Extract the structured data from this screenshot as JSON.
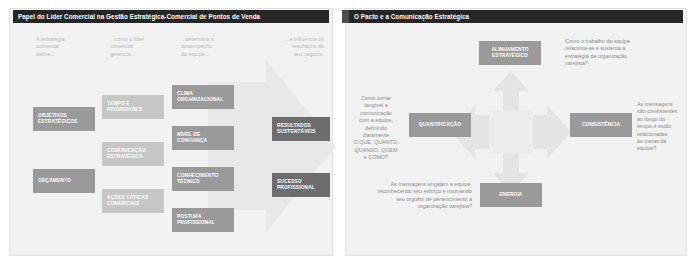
{
  "slide": {
    "background_color": "#ffffff",
    "panel_color": "#f2f2f2",
    "title_bar_color": "#262626",
    "box_mid_color": "#9a9a9a",
    "box_light_color": "#c6c6c6",
    "box_dark_color": "#6d6d6d",
    "caption_color": "#b9b9b9"
  },
  "left_panel": {
    "title": "Papel do Líder Comercial na Gestão Estratégica-Comercial de Pontos de Venda",
    "captions": [
      {
        "text": "A estratégia\ncomercial\ndefine..."
      },
      {
        "text": "...como o líder\ncomercial\ngerencia..."
      },
      {
        "text": "...determina o\ndesempenho\nda equipe..."
      },
      {
        "text": "...e influencia os\nresultados do\nseu negócio."
      }
    ],
    "column_1": [
      {
        "label": "OBJETIVOS\nESTRATÉGICOS"
      },
      {
        "label": "ORÇAMENTO"
      }
    ],
    "column_2": [
      {
        "label": "TEMPO E\nPRIORIDADES"
      },
      {
        "label": "COMUNICAÇÃO\nESTRATÉGICA"
      },
      {
        "label": "AÇÕES TÁTICAS\nCOMERCIAIS"
      }
    ],
    "column_3": [
      {
        "label": "CLIMA\nORGANIZACIONAL"
      },
      {
        "label": "NÍVEL DE\nCONFIANÇA"
      },
      {
        "label": "CONHECIMENTO\nTÉCNICO"
      },
      {
        "label": "POSTURA\nPROFISSIONAL"
      }
    ],
    "column_4": [
      {
        "label": "RESULTADOS\nSUSTENTÁVEIS"
      },
      {
        "label": "SUCESSO\nPROFISSIONAL"
      }
    ]
  },
  "right_panel": {
    "title": "O Pacto e a Comunicação Estratégica",
    "top_box": {
      "label": "ALINHAMENTO\nESTRATÉGICO"
    },
    "top_caption": "Como o trabalho da equipe\nrelaciona-se e sustenta a\nestratégia da organização\nvarejista?",
    "left_box": {
      "label": "QUANTIFICAÇÃO"
    },
    "left_caption": "Como tornar\ntangível a\ncomunicação\ncom a equipe,\ndefinindo\nclaramente\nO QUE, QUANTO,\nQUANDO, QUEM\ne COMO?",
    "right_box": {
      "label": "CONSISTÊNCIA"
    },
    "right_caption": "As mensagens\nsão consistentes\nao longo do\ntempo e estão\nrelacionadas\nàs metas da\nequipe?",
    "bottom_box": {
      "label": "ENERGIA"
    },
    "bottom_caption": "As mensagens engajam a equipe,\nreconhecendo seu esforço e motivando\nseu orgulho de pertencimento à\norganização varejista?"
  }
}
